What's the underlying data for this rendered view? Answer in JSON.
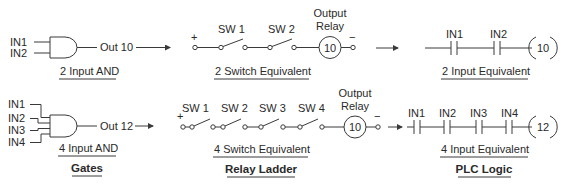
{
  "diagram": {
    "title_sections": {
      "gates": "Gates",
      "relay_ladder": "Relay Ladder",
      "plc_logic": "PLC Logic"
    },
    "top_row": {
      "gate": {
        "inputs": [
          "IN1",
          "IN2"
        ],
        "output_label": "Out 10",
        "caption": "2 Input AND"
      },
      "relay": {
        "plus": "+",
        "minus": "−",
        "switches": [
          "SW 1",
          "SW 2"
        ],
        "relay_title_line1": "Output",
        "relay_title_line2": "Relay",
        "relay_number": "10",
        "caption": "2 Switch Equivalent"
      },
      "plc": {
        "contacts": [
          "IN1",
          "IN2"
        ],
        "coil_number": "10",
        "caption": "2 Input Equivalent"
      }
    },
    "bottom_row": {
      "gate": {
        "inputs": [
          "IN1",
          "IN2",
          "IN3",
          "IN4"
        ],
        "output_label": "Out 12",
        "caption": "4 Input AND"
      },
      "relay": {
        "plus": "+",
        "minus": "−",
        "switches": [
          "SW 1",
          "SW 2",
          "SW 3",
          "SW 4"
        ],
        "relay_title_line1": "Output",
        "relay_title_line2": "Relay",
        "relay_number": "10",
        "caption": "4 Switch Equivalent"
      },
      "plc": {
        "contacts": [
          "IN1",
          "IN2",
          "IN3",
          "IN4"
        ],
        "coil_number": "12",
        "caption": "4 Input Equivalent"
      }
    }
  }
}
